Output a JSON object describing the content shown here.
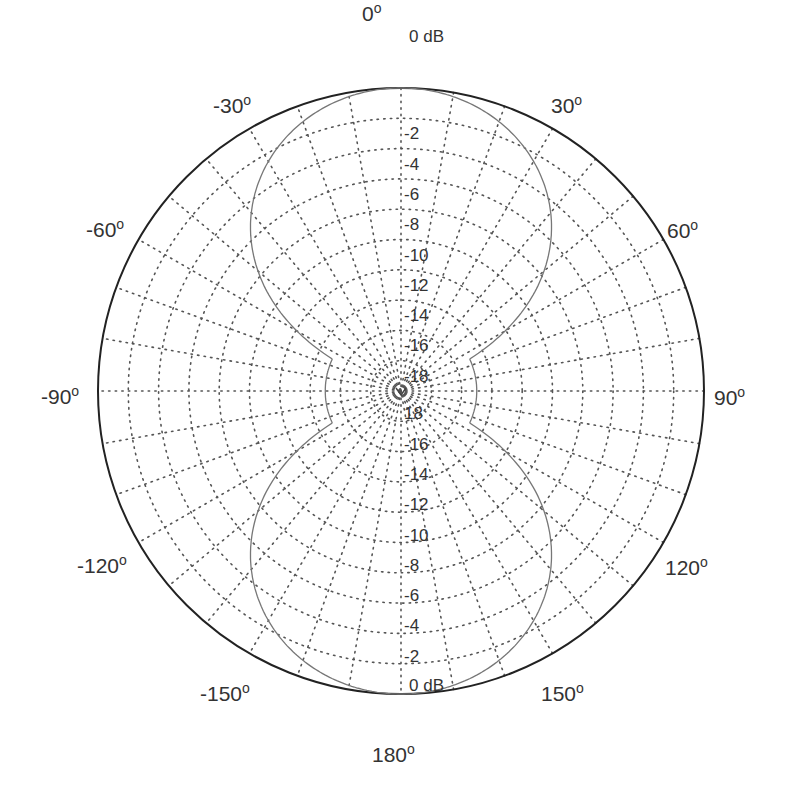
{
  "chart_data": {
    "type": "polar",
    "title": "",
    "subtitle": "",
    "radial_axis": {
      "unit": "dB",
      "min": -20,
      "max": 0,
      "step": 2,
      "tick_labels_upper": [
        "0 dB",
        "-2",
        "-4",
        "-6",
        "-8",
        "-10",
        "-12",
        "-14",
        "-16",
        "-18"
      ],
      "tick_labels_lower": [
        "18",
        "-16",
        "-14",
        "-12",
        "-10",
        "-8",
        "-6",
        "-4",
        "-2",
        "0 dB"
      ]
    },
    "angular_axis": {
      "unit": "degrees",
      "direction": "clockwise",
      "zero_location": "top",
      "grid_step": 10,
      "tick_labels": [
        {
          "angle": 0,
          "label": "0"
        },
        {
          "angle": 30,
          "label": "30"
        },
        {
          "angle": 60,
          "label": "60"
        },
        {
          "angle": 90,
          "label": "90"
        },
        {
          "angle": 120,
          "label": "120"
        },
        {
          "angle": 150,
          "label": "150"
        },
        {
          "angle": 180,
          "label": "180"
        },
        {
          "angle": -150,
          "label": "-150"
        },
        {
          "angle": -120,
          "label": "-120"
        },
        {
          "angle": -90,
          "label": "-90"
        },
        {
          "angle": -60,
          "label": "-60"
        },
        {
          "angle": -30,
          "label": "-30"
        }
      ],
      "degree_symbol": "o"
    },
    "grid": true,
    "legend": null,
    "series": [
      {
        "name": "radiation pattern",
        "description": "figure-eight (dipole-like) pattern, approx 40*log10|cos(theta)| dB floored at about -15 dB",
        "theta_deg": [
          0,
          10,
          20,
          30,
          40,
          45,
          50,
          55,
          60,
          65,
          70,
          80,
          90,
          100,
          110,
          115,
          120,
          125,
          130,
          135,
          140,
          150,
          160,
          170,
          180,
          -170,
          -160,
          -150,
          -140,
          -135,
          -130,
          -125,
          -120,
          -115,
          -110,
          -100,
          -90,
          -80,
          -70,
          -65,
          -60,
          -55,
          -50,
          -45,
          -40,
          -30,
          -20,
          -10
        ],
        "r_db": [
          0,
          -0.3,
          -1.1,
          -2.5,
          -4.6,
          -6.0,
          -7.7,
          -9.7,
          -12.0,
          -15.0,
          -15.0,
          -15.0,
          -15.0,
          -15.0,
          -15.0,
          -15.0,
          -12.0,
          -9.7,
          -7.7,
          -6.0,
          -4.6,
          -2.5,
          -1.1,
          -0.3,
          0,
          -0.3,
          -1.1,
          -2.5,
          -4.6,
          -6.0,
          -7.7,
          -9.7,
          -12.0,
          -15.0,
          -15.0,
          -15.0,
          -15.0,
          -15.0,
          -15.0,
          -15.0,
          -12.0,
          -9.7,
          -7.7,
          -6.0,
          -4.6,
          -2.5,
          -1.1,
          -0.3
        ]
      }
    ],
    "layout": {
      "center": [
        401,
        391
      ],
      "radius_px": 303,
      "floor_db": -15
    }
  },
  "labels": {
    "a0": "0",
    "a30": "30",
    "a60": "60",
    "a90": "90",
    "a120": "120",
    "a150": "150",
    "a180": "180",
    "am150": "-150",
    "am120": "-120",
    "am90": "-90",
    "am60": "-60",
    "am30": "-30",
    "deg": "o",
    "db_top": "0 dB",
    "db_bottom": "0 dB",
    "upper": [
      "-2",
      "-4",
      "-6",
      "-8",
      "-10",
      "-12",
      "-14",
      "-16",
      "-18"
    ],
    "lower": [
      "18",
      "-16",
      "-14",
      "-12",
      "-10",
      "-8",
      "-6",
      "-4",
      "-2"
    ]
  }
}
